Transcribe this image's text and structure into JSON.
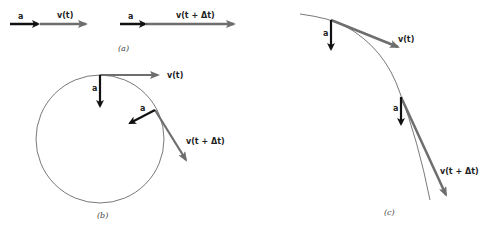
{
  "figure": {
    "panels": [
      {
        "id": "a",
        "caption": "(a)",
        "rows": [
          {
            "accel_label": "a",
            "velocity_label": "v(t)"
          },
          {
            "accel_label": "a",
            "velocity_label": "v(t + Δt)"
          }
        ]
      },
      {
        "id": "b",
        "caption": "(b)",
        "points": [
          {
            "accel_label": "a",
            "velocity_label": "v(t)"
          },
          {
            "accel_label": "a",
            "velocity_label": "v(t + Δt)"
          }
        ]
      },
      {
        "id": "c",
        "caption": "(c)",
        "points": [
          {
            "accel_label": "a",
            "velocity_label": "v(t)"
          },
          {
            "accel_label": "a",
            "velocity_label": "v(t + Δt)"
          }
        ]
      }
    ],
    "colors": {
      "acceleration": "#111111",
      "velocity": "#6e6e6e",
      "path": "#555555"
    }
  }
}
